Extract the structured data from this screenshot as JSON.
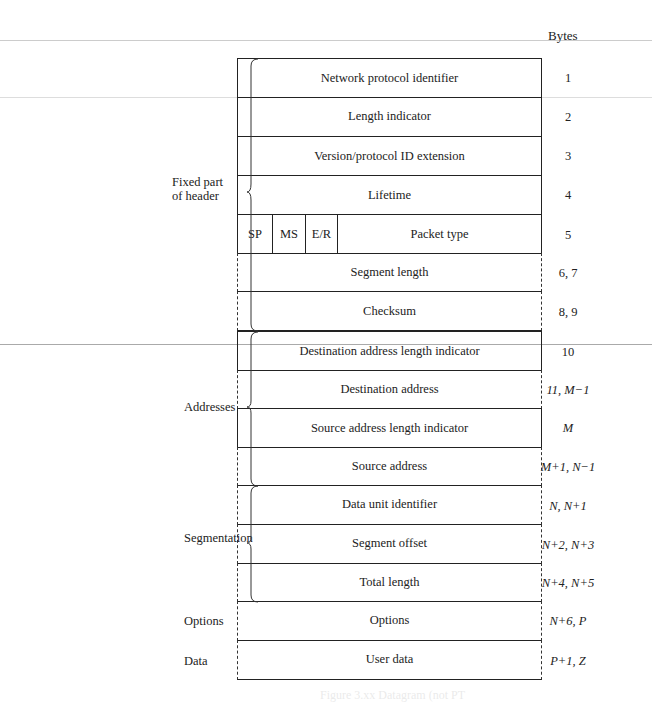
{
  "header": {
    "bytes_label": "Bytes"
  },
  "groups": [
    {
      "label_line1": "Fixed part",
      "label_line2": "of header"
    },
    {
      "label_line1": "Addresses",
      "label_line2": ""
    },
    {
      "label_line1": "Segmentation",
      "label_line2": ""
    },
    {
      "label_line1": "Options",
      "label_line2": ""
    },
    {
      "label_line1": "Data",
      "label_line2": ""
    }
  ],
  "rows": [
    {
      "label": "Network protocol identifier",
      "bytes": "1"
    },
    {
      "label": "Length indicator",
      "bytes": "2"
    },
    {
      "label": "Version/protocol ID extension",
      "bytes": "3"
    },
    {
      "label": "Lifetime",
      "bytes": "4"
    },
    {
      "label": "Packet type",
      "bytes": "5",
      "flags": [
        "SP",
        "MS",
        "E/R"
      ]
    },
    {
      "label": "Segment length",
      "bytes": "6, 7"
    },
    {
      "label": "Checksum",
      "bytes": "8, 9"
    },
    {
      "label": "Destination address length indicator",
      "bytes": "10"
    },
    {
      "label": "Destination address",
      "bytes": "11, M−1"
    },
    {
      "label": "Source address length indicator",
      "bytes": "M"
    },
    {
      "label": "Source address",
      "bytes": "M+1, N−1"
    },
    {
      "label": "Data unit identifier",
      "bytes": "N, N+1"
    },
    {
      "label": "Segment offset",
      "bytes": "N+2, N+3"
    },
    {
      "label": "Total length",
      "bytes": "N+4, N+5"
    },
    {
      "label": "Options",
      "bytes": "N+6, P"
    },
    {
      "label": "User data",
      "bytes": "P+1, Z"
    }
  ],
  "caption": "Figure 3.xx Datagram (not PT"
}
